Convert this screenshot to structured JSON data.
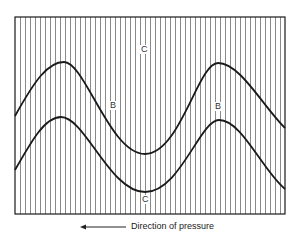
{
  "figure": {
    "frame": {
      "x": 15,
      "y": 17,
      "width": 270,
      "height": 197
    },
    "stripes": {
      "spacing": 5,
      "color": "#8a8a8a"
    },
    "line_color": "#1a1a1a",
    "curves": [
      {
        "name": "upper-fold-layer",
        "path": "M15,116 C35,80 48,62 64,62 C85,62 110,154 145,154 C180,154 198,63 218,63 C240,63 262,105 285,128"
      },
      {
        "name": "lower-fold-layer",
        "path": "M15,170 C32,140 45,117 61,117 C85,117 110,192 145,192 C180,192 200,120 219,120 C242,120 262,170 285,189"
      }
    ],
    "labels": [
      {
        "id": "label-c-top",
        "text": "C",
        "x": 140,
        "y": 45
      },
      {
        "id": "label-b-left",
        "text": "B",
        "x": 109,
        "y": 101
      },
      {
        "id": "label-b-right",
        "text": "B",
        "x": 214,
        "y": 102
      },
      {
        "id": "label-c-bottom",
        "text": "C",
        "x": 141,
        "y": 195
      }
    ],
    "caption": "Direction of pressure",
    "arrow_direction": "left"
  }
}
